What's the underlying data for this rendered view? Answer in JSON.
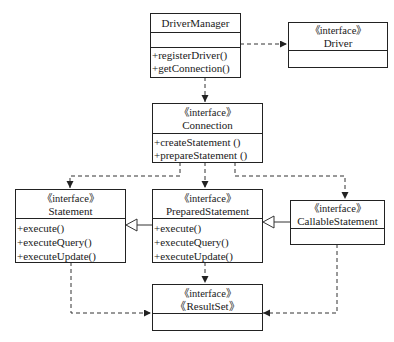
{
  "diagram": {
    "type": "uml-class-diagram",
    "classes": {
      "driver_manager": {
        "name": "DriverManager",
        "stereotype": "",
        "operations": [
          "+registerDriver()",
          "+getConnection()"
        ]
      },
      "driver": {
        "stereotype": "《interface》",
        "name": "Driver",
        "operations": []
      },
      "connection": {
        "stereotype": "《interface》",
        "name": "Connection",
        "operations": [
          "+createStatement ()",
          "+prepareStatement ()"
        ]
      },
      "statement": {
        "stereotype": "《interface》",
        "name": "Statement",
        "operations": [
          "+execute()",
          "+executeQuery()",
          "+executeUpdate()"
        ]
      },
      "prepared_statement": {
        "stereotype": "《interface》",
        "name": "PreparedStatement",
        "operations": [
          "+execute()",
          "+executeQuery()",
          "+executeUpdate()"
        ]
      },
      "callable_statement": {
        "stereotype": "《interface》",
        "name": "CallableStatement",
        "operations": []
      },
      "result_set": {
        "stereotype": "《interface》",
        "name": "《ResultSet》",
        "operations": []
      }
    },
    "relations": [
      {
        "from": "DriverManager",
        "to": "Driver",
        "kind": "dependency"
      },
      {
        "from": "DriverManager",
        "to": "Connection",
        "kind": "dependency"
      },
      {
        "from": "Connection",
        "to": "Statement",
        "kind": "dependency"
      },
      {
        "from": "Connection",
        "to": "PreparedStatement",
        "kind": "dependency"
      },
      {
        "from": "Connection",
        "to": "CallableStatement",
        "kind": "dependency"
      },
      {
        "from": "PreparedStatement",
        "to": "Statement",
        "kind": "generalization"
      },
      {
        "from": "CallableStatement",
        "to": "PreparedStatement",
        "kind": "generalization"
      },
      {
        "from": "Statement",
        "to": "ResultSet",
        "kind": "dependency"
      },
      {
        "from": "PreparedStatement",
        "to": "ResultSet",
        "kind": "dependency"
      },
      {
        "from": "CallableStatement",
        "to": "ResultSet",
        "kind": "dependency"
      }
    ],
    "colors": {
      "line": "#222222",
      "background": "#ffffff"
    }
  }
}
